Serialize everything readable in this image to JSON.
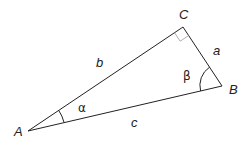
{
  "diagram": {
    "title": "",
    "vertices": {
      "A": {
        "label": "A",
        "x": 28,
        "y": 131
      },
      "B": {
        "label": "B",
        "x": 222,
        "y": 86
      },
      "C": {
        "label": "C",
        "x": 183,
        "y": 27
      }
    },
    "sides": {
      "a": {
        "label": "a"
      },
      "b": {
        "label": "b"
      },
      "c": {
        "label": "c"
      }
    },
    "angles": {
      "alpha": {
        "label": "α"
      },
      "beta": {
        "label": "β"
      },
      "right": {
        "at": "C"
      }
    },
    "colors": {
      "line": "#222222",
      "right_angle_marker": "#999999"
    }
  }
}
